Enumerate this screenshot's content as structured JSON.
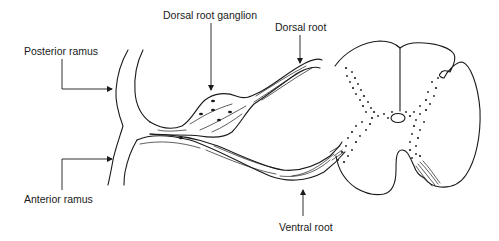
{
  "diagram": {
    "labels": {
      "posterior_ramus": "Posterior ramus",
      "anterior_ramus": "Anterior ramus",
      "dorsal_root_ganglion": "Dorsal root ganglion",
      "dorsal_root": "Dorsal root",
      "ventral_root": "Ventral root"
    },
    "colors": {
      "ink": "#1a1a1a",
      "background": "#ffffff"
    }
  }
}
